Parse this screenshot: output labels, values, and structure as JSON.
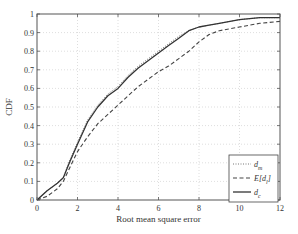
{
  "chart_data": {
    "type": "line",
    "title": "",
    "xlabel": "Root mean square error",
    "ylabel": "CDF",
    "xlim": [
      0,
      12
    ],
    "ylim": [
      0,
      1
    ],
    "grid": true,
    "legend_position": "lower right",
    "x_ticks": [
      "0",
      "2",
      "4",
      "6",
      "8",
      "10",
      "12"
    ],
    "y_ticks": [
      "0",
      "0.1",
      "0.2",
      "0.3",
      "0.4",
      "0.5",
      "0.6",
      "0.7",
      "0.8",
      "0.9",
      "1"
    ],
    "x": [
      0,
      0.5,
      1,
      1.3,
      1.6,
      2,
      2.5,
      3,
      3.5,
      4,
      4.5,
      5,
      5.5,
      6,
      6.5,
      7,
      7.5,
      8,
      8.5,
      9,
      10,
      11,
      12
    ],
    "series": [
      {
        "name": "d_m",
        "legend_label": "d",
        "legend_sub": "m",
        "style": "dotted",
        "color": "#777777",
        "values": [
          0,
          0.05,
          0.09,
          0.12,
          0.21,
          0.31,
          0.43,
          0.51,
          0.57,
          0.61,
          0.67,
          0.72,
          0.76,
          0.8,
          0.84,
          0.88,
          0.91,
          0.93,
          0.94,
          0.95,
          0.97,
          0.98,
          0.98
        ]
      },
      {
        "name": "E[d_l]",
        "legend_label": "E[d",
        "legend_sub": "l",
        "legend_suffix": "]",
        "style": "dashed",
        "color": "#444444",
        "values": [
          0,
          0.02,
          0.06,
          0.1,
          0.17,
          0.26,
          0.34,
          0.41,
          0.46,
          0.51,
          0.56,
          0.61,
          0.65,
          0.69,
          0.72,
          0.76,
          0.8,
          0.85,
          0.89,
          0.91,
          0.93,
          0.95,
          0.96
        ]
      },
      {
        "name": "d_c",
        "legend_label": "d",
        "legend_sub": "c",
        "style": "solid",
        "color": "#333333",
        "values": [
          0,
          0.05,
          0.09,
          0.12,
          0.2,
          0.3,
          0.42,
          0.5,
          0.56,
          0.6,
          0.66,
          0.71,
          0.75,
          0.79,
          0.83,
          0.87,
          0.91,
          0.93,
          0.94,
          0.95,
          0.97,
          0.98,
          0.98
        ]
      }
    ]
  }
}
